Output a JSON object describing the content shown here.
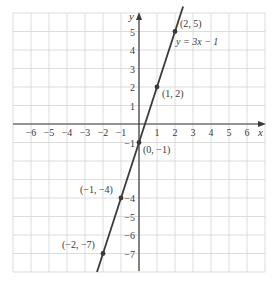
{
  "chart_data": {
    "type": "line",
    "title": "",
    "xlabel": "x",
    "ylabel": "y",
    "xlim": [
      -7,
      7
    ],
    "ylim": [
      -8,
      6
    ],
    "grid": true,
    "x_ticks": [
      -6,
      -5,
      -4,
      -3,
      -2,
      -1,
      1,
      2,
      3,
      4,
      5,
      6
    ],
    "x_tick_labels": [
      "−6",
      "−5",
      "−4",
      "−3",
      "−2",
      "−1",
      "1",
      "2",
      "3",
      "4",
      "5",
      "6"
    ],
    "y_ticks": [
      5,
      4,
      3,
      2,
      1,
      -1,
      -4,
      -5,
      -6,
      -7
    ],
    "y_tick_labels": [
      "5",
      "4",
      "3",
      "2",
      "1",
      "−1",
      "−4",
      "−5",
      "−6",
      "−7"
    ],
    "series": [
      {
        "name": "y = 3x − 1",
        "equation": "y = 3x − 1",
        "slope": 3,
        "intercept": -1,
        "x": [
          -2,
          -1,
          0,
          1,
          2
        ],
        "y": [
          -7,
          -4,
          -1,
          2,
          5
        ]
      }
    ],
    "annotations": [
      {
        "text": "(2, 5)",
        "x": 2,
        "y": 5
      },
      {
        "text": "(1, 2)",
        "x": 1,
        "y": 2
      },
      {
        "text": "(0, −1)",
        "x": 0,
        "y": -1
      },
      {
        "text": "(−1, −4)",
        "x": -1,
        "y": -4
      },
      {
        "text": "(−2, −7)",
        "x": -2,
        "y": -7
      },
      {
        "text": "y = 3x − 1",
        "x": 2,
        "y": 4.5
      }
    ]
  },
  "colors": {
    "grid": "#d4d4d4",
    "axis": "#3a3a3a",
    "line": "#3a3a3a",
    "text": "#3a3a3a"
  },
  "labels": {
    "x_axis": "x",
    "y_axis": "y",
    "equation": "y = 3x − 1",
    "point_2_5": "(2, 5)",
    "point_1_2": "(1, 2)",
    "point_0_m1": "(0, −1)",
    "point_m1_m4": "(−1, −4)",
    "point_m2_m7": "(−2, −7)"
  }
}
